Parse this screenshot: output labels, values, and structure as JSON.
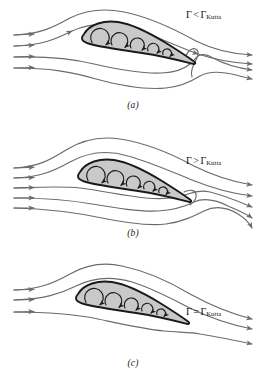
{
  "figure": {
    "stroke_color": "#6b6b6b",
    "outline_color": "#1a1a1a",
    "airfoil_fill": "#c9c9c9",
    "background": "#ffffff",
    "gamma_symbol": "Γ",
    "kutta_subscript": "Kutta"
  },
  "panels": [
    {
      "id": "a",
      "caption": "(a)",
      "label": {
        "gamma": "Γ",
        "operator": "<",
        "gamma2": "Γ",
        "subscript": "Kutta",
        "full": "Γ < ΓKutta"
      },
      "description": "Circulation less than Kutta value; rear stagnation point on upper surface, flow curls around trailing edge",
      "inlet_streamline_count": 4,
      "outlet_streamline_count": 4,
      "vortex_arrow_count": 5,
      "stagnation_location": "upper-surface-forward-of-trailing-edge"
    },
    {
      "id": "b",
      "caption": "(b)",
      "label": {
        "gamma": "Γ",
        "operator": ">",
        "gamma2": "Γ",
        "subscript": "Kutta",
        "full": "Γ > ΓKutta"
      },
      "description": "Circulation greater than Kutta value; rear stagnation point on lower surface, flow curls up around trailing edge",
      "inlet_streamline_count": 5,
      "outlet_streamline_count": 5,
      "vortex_arrow_count": 5,
      "stagnation_location": "lower-surface-forward-of-trailing-edge"
    },
    {
      "id": "c",
      "caption": "(c)",
      "label": {
        "gamma": "Γ",
        "operator": "=",
        "gamma2": "Γ",
        "subscript": "Kutta",
        "full": "Γ = ΓKutta"
      },
      "description": "Circulation equals Kutta value; flow leaves smoothly at the sharp trailing edge",
      "inlet_streamline_count": 3,
      "outlet_streamline_count": 3,
      "vortex_arrow_count": 5,
      "stagnation_location": "trailing-edge"
    }
  ]
}
